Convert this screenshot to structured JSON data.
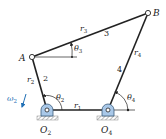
{
  "diagram": {
    "type": "four-bar linkage",
    "points": {
      "A": {
        "label": "A"
      },
      "B": {
        "label": "B"
      },
      "O2": {
        "label": "O",
        "sub": "2"
      },
      "O4": {
        "label": "O",
        "sub": "4"
      }
    },
    "links": [
      {
        "id": "r1",
        "label": "r",
        "sub": "1",
        "number": ""
      },
      {
        "id": "r2",
        "label": "r",
        "sub": "2",
        "number": "2"
      },
      {
        "id": "r3",
        "label": "r",
        "sub": "3",
        "number": "3"
      },
      {
        "id": "r4",
        "label": "r",
        "sub": "4",
        "number": "4"
      }
    ],
    "angles": [
      {
        "id": "theta2",
        "label": "θ",
        "sub": "2"
      },
      {
        "id": "theta3",
        "label": "θ",
        "sub": "3"
      },
      {
        "id": "theta4",
        "label": "θ",
        "sub": "4"
      }
    ],
    "omega": {
      "label": "ω",
      "sub": "2"
    },
    "colors": {
      "link": "#222222",
      "pivot_fill": "#a9c8e8",
      "ground": "#888888",
      "omega": "#1f6fb5"
    }
  }
}
